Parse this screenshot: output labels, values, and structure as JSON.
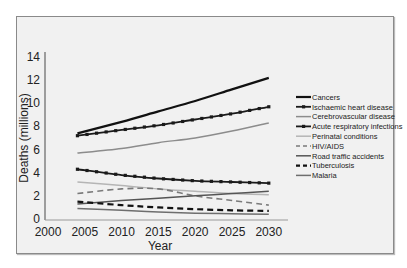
{
  "chart_data": {
    "type": "line",
    "title": "",
    "xlabel": "Year",
    "ylabel": "Deaths (millions)",
    "xlim": [
      2000,
      2030
    ],
    "ylim": [
      0,
      14
    ],
    "x_ticks": [
      "2000",
      "2005",
      "2010",
      "2015",
      "2020",
      "2025",
      "2030"
    ],
    "y_ticks": [
      "0",
      "2",
      "4",
      "6",
      "8",
      "10",
      "12",
      "14"
    ],
    "grid": false,
    "legend_position": "right",
    "x": [
      2004,
      2010,
      2015,
      2020,
      2025,
      2030
    ],
    "series": [
      {
        "name": "Cancers",
        "values": [
          7.4,
          8.4,
          9.3,
          10.2,
          11.2,
          12.2
        ],
        "color": "#111111",
        "style": "solid-thick"
      },
      {
        "name": "Ischaemic heart disease",
        "values": [
          7.2,
          7.7,
          8.1,
          8.6,
          9.1,
          9.7
        ],
        "color": "#1a1a1a",
        "style": "solid-markers"
      },
      {
        "name": "Cerebrovascular disease",
        "values": [
          5.7,
          6.1,
          6.6,
          7.0,
          7.6,
          8.3
        ],
        "color": "#8c8c8c",
        "style": "solid"
      },
      {
        "name": "Acute respiratory infections",
        "values": [
          4.3,
          3.8,
          3.5,
          3.3,
          3.2,
          3.1
        ],
        "color": "#1a1a1a",
        "style": "solid-markers"
      },
      {
        "name": "Perinatal conditions",
        "values": [
          3.2,
          2.9,
          2.6,
          2.4,
          2.2,
          2.1
        ],
        "color": "#b5b5b5",
        "style": "solid"
      },
      {
        "name": "HIV/AIDS",
        "values": [
          2.2,
          2.6,
          2.6,
          2.0,
          1.6,
          1.2
        ],
        "color": "#7a7a7a",
        "style": "dashed"
      },
      {
        "name": "Road traffic accidents",
        "values": [
          1.3,
          1.6,
          1.8,
          2.0,
          2.2,
          2.4
        ],
        "color": "#555555",
        "style": "solid"
      },
      {
        "name": "Tuberculosis",
        "values": [
          1.5,
          1.2,
          1.0,
          0.85,
          0.75,
          0.7
        ],
        "color": "#111111",
        "style": "dashed-thick"
      },
      {
        "name": "Malaria",
        "values": [
          0.9,
          0.75,
          0.6,
          0.5,
          0.45,
          0.4
        ],
        "color": "#6e6e6e",
        "style": "solid"
      }
    ]
  },
  "axes": {
    "xlabel": "Year",
    "ylabel": "Deaths (millions)"
  },
  "legend": {
    "items": [
      "Cancers",
      "Ischaemic heart disease",
      "Cerebrovascular disease",
      "Acute respiratory infections",
      "Perinatal conditions",
      "HIV/AIDS",
      "Road traffic accidents",
      "Tuberculosis",
      "Malaria"
    ]
  }
}
